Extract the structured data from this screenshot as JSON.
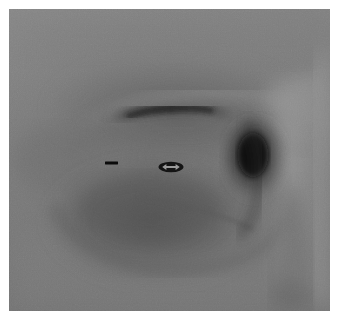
{
  "image": {
    "modality": "radiograph",
    "orientation": "lateral",
    "view_label": "",
    "border_color": "#ffffff",
    "background_tone": "#7c7c7c",
    "darkest_tone": "#121212",
    "lightest_tone": "#b4b4b4",
    "frame": {
      "x": 9,
      "y": 9,
      "width": 321,
      "height": 302
    }
  },
  "annotations": [
    {
      "id": "dash",
      "type": "dash-marker",
      "glyph": "—",
      "color": "#0b0b0b",
      "x": 96,
      "y": 152,
      "width": 13,
      "height": 4,
      "label": ""
    },
    {
      "id": "arrow",
      "type": "double-arrow-marker",
      "glyph": "⟷",
      "color": "#0b0b0b",
      "x": 149,
      "y": 151,
      "width": 26,
      "height": 14,
      "label": ""
    }
  ],
  "regions": [
    {
      "name": "upper-bony-ridge",
      "tone": "#6a6a6a"
    },
    {
      "name": "linear-lucency-band",
      "tone": "#3a3a3a"
    },
    {
      "name": "central-soft-tissue-mass",
      "tone": "#5e5e5e"
    },
    {
      "name": "right-radiolucent-focus",
      "tone": "#1c1c1c"
    },
    {
      "name": "right-dense-column",
      "tone": "#8e8e8e"
    },
    {
      "name": "lower-field",
      "tone": "#787878"
    }
  ]
}
